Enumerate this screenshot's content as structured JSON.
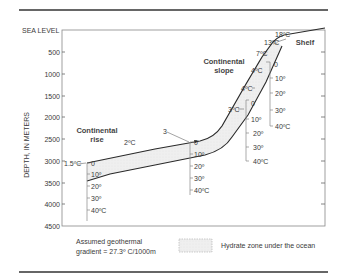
{
  "diagram": {
    "y_axis": {
      "label": "DEPTH, IN METERS",
      "top_label": "SEA LEVEL",
      "ticks": [
        "500",
        "1000",
        "1500",
        "2000",
        "2500",
        "3000",
        "3500",
        "4000",
        "4500"
      ]
    },
    "regions": {
      "rise": "Continental\nrise",
      "rise_line1": "Continental",
      "rise_line2": "rise",
      "slope_line1": "Continental",
      "slope_line2": "slope",
      "shelf": "Shelf"
    },
    "seafloor_temps": {
      "t18": "18ºC",
      "t13": "13ºC",
      "t7": "7ºC",
      "t4a": "4ºC",
      "t4b": "4ºC",
      "t3a": "3ºC",
      "t3b": "3",
      "t2": "2ºC",
      "t15": "1.5ºC"
    },
    "gradient_scales": [
      {
        "id": "rise",
        "labels": [
          "0",
          "10º",
          "20º",
          "30º",
          "40ºC"
        ]
      },
      {
        "id": "mid",
        "labels": [
          "0",
          "10º",
          "20º",
          "30º",
          "40ºC"
        ]
      },
      {
        "id": "lower-slope",
        "labels": [
          "0",
          "10º",
          "20º",
          "30º",
          "40ºC"
        ]
      },
      {
        "id": "upper-slope",
        "labels": [
          "0",
          "10º",
          "20º",
          "30º",
          "40ºC"
        ]
      }
    ],
    "legend": {
      "gradient_line1": "Assumed geothermal",
      "gradient_line2": "gradient = 27.3º C/1000m",
      "hydrate_label": "Hydrate zone under the ocean"
    },
    "colors": {
      "line": "#2a2a2a",
      "frame": "#777777",
      "hydrate_fill": "#ececec"
    }
  }
}
